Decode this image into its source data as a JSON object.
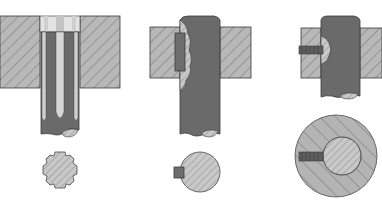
{
  "diagram": {
    "colors": {
      "background": "#ffffff",
      "hub_fill": "#b8b8b8",
      "hatch": "#7c7c7c",
      "shaft_fill": "#6a6a6a",
      "shaft_highlight": "#d6d6d6",
      "outline": "#3a3a3a",
      "section_fill": "#c4c4c4",
      "key_fill": "#6e6e6e"
    },
    "panels": [
      {
        "id": "splined-shaft",
        "label": ""
      },
      {
        "id": "feather-key",
        "label": ""
      },
      {
        "id": "set-screw",
        "label": ""
      }
    ]
  }
}
